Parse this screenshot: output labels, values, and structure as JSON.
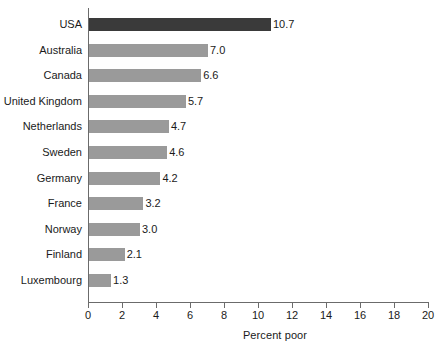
{
  "chart_data": {
    "type": "bar",
    "orientation": "horizontal",
    "title": "",
    "xlabel": "Percent poor",
    "ylabel": "",
    "xlim": [
      0,
      20
    ],
    "xticks": [
      0,
      2,
      4,
      6,
      8,
      10,
      12,
      14,
      16,
      18,
      20
    ],
    "xtick_labels": [
      "0",
      "2",
      "4",
      "6",
      "8",
      "10",
      "12",
      "14",
      "16",
      "18",
      "20"
    ],
    "grid": false,
    "legend": null,
    "categories": [
      "USA",
      "Australia",
      "Canada",
      "United Kingdom",
      "Netherlands",
      "Sweden",
      "Germany",
      "France",
      "Norway",
      "Finland",
      "Luxembourg"
    ],
    "values": [
      10.7,
      7.0,
      6.6,
      5.7,
      4.7,
      4.6,
      4.2,
      3.2,
      3.0,
      2.1,
      1.3
    ],
    "value_labels": [
      "10.7",
      "7.0",
      "6.6",
      "5.7",
      "4.7",
      "4.6",
      "4.2",
      "3.2",
      "3.0",
      "2.1",
      "1.3"
    ],
    "highlight_index": 0,
    "colors": {
      "bar": "#9a9a9a",
      "bar_highlight": "#3a3a3a",
      "axis": "#6b6b6b",
      "text": "#1a1a1a",
      "background": "#ffffff"
    }
  }
}
